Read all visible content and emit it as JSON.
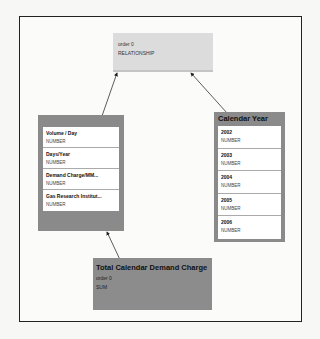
{
  "diagram": {
    "nodes": {
      "relationship": {
        "order": "order 0",
        "type": "RELATIONSHIP"
      },
      "inputs": {
        "items": [
          {
            "name": "Volume / Day",
            "type": "NUMBER"
          },
          {
            "name": "Days/Year",
            "type": "NUMBER"
          },
          {
            "name": "Demand Charge/MM...",
            "type": "NUMBER"
          },
          {
            "name": "Gas Research Institut...",
            "type": "NUMBER"
          }
        ]
      },
      "calendar_year": {
        "title": "Calendar Year",
        "items": [
          {
            "name": "2002",
            "type": "NUMBER"
          },
          {
            "name": "2003",
            "type": "NUMBER"
          },
          {
            "name": "2004",
            "type": "NUMBER"
          },
          {
            "name": "2005",
            "type": "NUMBER"
          },
          {
            "name": "2006",
            "type": "NUMBER"
          }
        ]
      },
      "total": {
        "title": "Total Calendar Demand Charge",
        "order": "order 0",
        "aggregation": "SUM"
      }
    },
    "edges": [
      {
        "from": "inputs",
        "to": "relationship"
      },
      {
        "from": "calendar_year",
        "to": "relationship"
      },
      {
        "from": "total",
        "to": "inputs"
      }
    ],
    "colors": {
      "node_dark": "#8a8a8a",
      "node_light": "#dcdcdc",
      "frame": "#222222"
    }
  }
}
